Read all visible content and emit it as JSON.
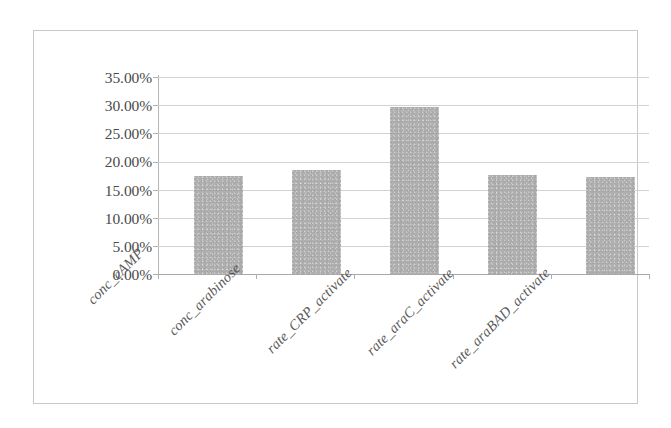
{
  "chart_data": {
    "type": "bar",
    "title": "",
    "subtitle": "",
    "xlabel": "",
    "ylabel": "",
    "categories": [
      "conc_cAMP",
      "conc_arabinose",
      "rate_CRP_activate",
      "rate_araC_activate",
      "rate_araBAD_activate"
    ],
    "values": [
      17.4,
      18.5,
      29.6,
      17.6,
      17.2
    ],
    "value_format": "percent",
    "ylim": [
      0,
      35
    ],
    "ytick_labels": [
      "0.00%",
      "5.00%",
      "10.00%",
      "15.00%",
      "20.00%",
      "25.00%",
      "30.00%",
      "35.00%"
    ],
    "ytick_values": [
      0,
      5,
      10,
      15,
      20,
      25,
      30,
      35
    ],
    "grid": true,
    "grid_axis": "y",
    "legend": false,
    "legend_position": "none",
    "series": [
      {
        "name": "",
        "values": [
          17.4,
          18.5,
          29.6,
          17.6,
          17.2
        ]
      }
    ],
    "colors": {
      "bar_fill": "#a9a9a9",
      "gridline": "#d2d2d2",
      "axis_line": "#b0b0b0",
      "tick_label": "#4b4b4b",
      "category_label": "#5a5a5a",
      "frame_border": "#c9c9c9",
      "background": "#ffffff"
    }
  }
}
